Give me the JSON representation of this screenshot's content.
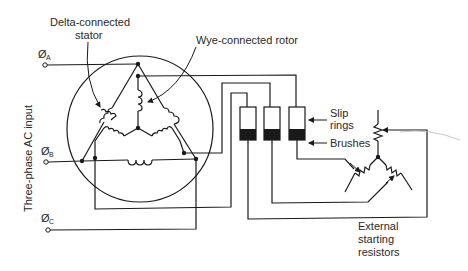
{
  "labels": {
    "stator": [
      "Delta-connected",
      "stator"
    ],
    "rotor": "Wye-connected rotor",
    "input": "Three-phase AC input",
    "slip_rings": [
      "Slip",
      "rings"
    ],
    "brushes": "Brushes",
    "resistors": [
      "External",
      "starting",
      "resistors"
    ]
  },
  "phases": [
    {
      "symbol": "Ø",
      "sub": "A"
    },
    {
      "symbol": "Ø",
      "sub": "B"
    },
    {
      "symbol": "Ø",
      "sub": "C"
    }
  ],
  "colors": {
    "line": "#1a1a1a",
    "text": "#2a2a2a",
    "background": "#ffffff"
  }
}
